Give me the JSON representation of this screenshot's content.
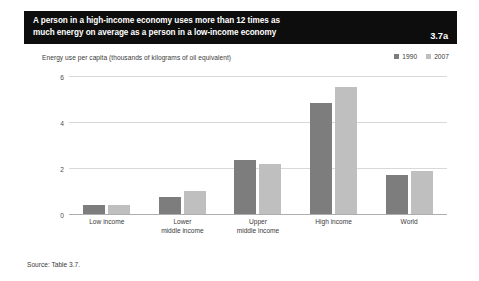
{
  "figure": {
    "title": "A person in a high-income economy uses more than 12 times as\nmuch energy on average as a person in a low-income economy",
    "number": "3.7a",
    "source": "Source: Table 3.7."
  },
  "colors": {
    "banner_background": "#0d0d0d",
    "banner_text": "#ffffff",
    "series_1990": "#7d7d7d",
    "series_2007": "#bfbfbf",
    "gridline": "#d8d8d8",
    "axis": "#aeaeae"
  },
  "chart_data": {
    "type": "bar",
    "title": "A person in a high-income economy uses more than 12 times as much energy on average as a person in a low-income economy",
    "subtitle": "Energy use per capita (thousands of kilograms of oil equivalent)",
    "xlabel": "",
    "ylabel": "",
    "categories": [
      "Low income",
      "Lower\nmiddle income",
      "Upper\nmiddle income",
      "High income",
      "World"
    ],
    "series": [
      {
        "name": "1990",
        "color": "#7d7d7d",
        "values": [
          0.45,
          0.8,
          2.4,
          4.85,
          1.75
        ]
      },
      {
        "name": "2007",
        "color": "#bfbfbf",
        "values": [
          0.45,
          1.05,
          2.2,
          5.55,
          1.9
        ]
      }
    ],
    "ylim": [
      0,
      6
    ],
    "yticks": [
      0,
      2,
      4,
      6
    ],
    "ytick_labels": [
      "0",
      "2",
      "4",
      "6"
    ],
    "grid": true,
    "legend_position": "top-right"
  }
}
